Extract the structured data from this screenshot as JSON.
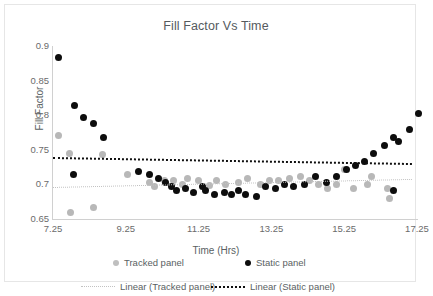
{
  "chart_data": {
    "type": "scatter",
    "title": "Fill Factor Vs Time",
    "xlabel": "Time (Hrs)",
    "ylabel": "Fill Factor",
    "xlim": [
      7.25,
      17.25
    ],
    "ylim": [
      0.65,
      0.9
    ],
    "xticks": [
      "7.25",
      "9.25",
      "11.25",
      "13.25",
      "15.25",
      "17.25"
    ],
    "yticks": [
      "0.9",
      "0.85",
      "0.8",
      "0.75",
      "0.7",
      "0.65"
    ],
    "grid": false,
    "legend_position": "bottom",
    "series": [
      {
        "name": "Tracked panel",
        "color": "#b8b8b8",
        "marker": "circle",
        "points": [
          [
            7.4,
            0.771
          ],
          [
            7.7,
            0.745
          ],
          [
            7.73,
            0.659
          ],
          [
            8.35,
            0.667
          ],
          [
            8.6,
            0.743
          ],
          [
            9.3,
            0.715
          ],
          [
            9.9,
            0.703
          ],
          [
            10.05,
            0.697
          ],
          [
            10.3,
            0.706
          ],
          [
            10.55,
            0.706
          ],
          [
            10.8,
            0.7
          ],
          [
            10.95,
            0.709
          ],
          [
            11.25,
            0.706
          ],
          [
            11.55,
            0.699
          ],
          [
            11.75,
            0.705
          ],
          [
            12.0,
            0.7
          ],
          [
            12.35,
            0.703
          ],
          [
            12.6,
            0.709
          ],
          [
            12.95,
            0.7
          ],
          [
            13.2,
            0.706
          ],
          [
            13.45,
            0.706
          ],
          [
            13.75,
            0.709
          ],
          [
            14.05,
            0.712
          ],
          [
            14.3,
            0.706
          ],
          [
            14.55,
            0.7
          ],
          [
            14.8,
            0.694
          ],
          [
            15.05,
            0.7
          ],
          [
            15.25,
            0.721
          ],
          [
            15.5,
            0.694
          ],
          [
            15.9,
            0.7
          ],
          [
            16.0,
            0.712
          ],
          [
            16.45,
            0.694
          ],
          [
            16.5,
            0.68
          ]
        ]
      },
      {
        "name": "Static panel",
        "color": "#0d0d0d",
        "marker": "circle",
        "points": [
          [
            7.4,
            0.883
          ],
          [
            7.85,
            0.814
          ],
          [
            8.1,
            0.797
          ],
          [
            8.35,
            0.788
          ],
          [
            8.65,
            0.768
          ],
          [
            7.8,
            0.715
          ],
          [
            9.6,
            0.718
          ],
          [
            9.9,
            0.715
          ],
          [
            10.15,
            0.709
          ],
          [
            10.35,
            0.703
          ],
          [
            10.5,
            0.697
          ],
          [
            10.65,
            0.691
          ],
          [
            10.9,
            0.694
          ],
          [
            11.1,
            0.688
          ],
          [
            11.35,
            0.697
          ],
          [
            11.45,
            0.691
          ],
          [
            11.7,
            0.685
          ],
          [
            11.95,
            0.688
          ],
          [
            12.15,
            0.685
          ],
          [
            12.35,
            0.691
          ],
          [
            12.55,
            0.685
          ],
          [
            12.85,
            0.683
          ],
          [
            13.1,
            0.697
          ],
          [
            13.35,
            0.694
          ],
          [
            13.6,
            0.7
          ],
          [
            13.85,
            0.697
          ],
          [
            14.15,
            0.7
          ],
          [
            14.45,
            0.712
          ],
          [
            14.75,
            0.703
          ],
          [
            15.05,
            0.712
          ],
          [
            15.3,
            0.721
          ],
          [
            15.55,
            0.727
          ],
          [
            15.8,
            0.733
          ],
          [
            16.05,
            0.744
          ],
          [
            16.35,
            0.756
          ],
          [
            16.6,
            0.768
          ],
          [
            16.75,
            0.762
          ],
          [
            16.6,
            0.691
          ],
          [
            17.05,
            0.78
          ],
          [
            17.3,
            0.803
          ]
        ]
      }
    ],
    "trendlines": [
      {
        "name": "Linear (Tracked panel)",
        "color": "#c2c2c2",
        "style": "dotted",
        "x0": 7.25,
        "y0": 0.6958,
        "x1": 17.1,
        "y1": 0.7075
      },
      {
        "name": "Linear (Static panel)",
        "color": "#0f0f0f",
        "style": "dotted",
        "x0": 7.25,
        "y0": 0.7397,
        "x1": 17.1,
        "y1": 0.731
      }
    ]
  },
  "legend": {
    "tracked_panel": "Tracked panel",
    "static_panel": "Static panel",
    "linear_tracked_panel": "Linear (Tracked panel)",
    "linear_static_panel": "Linear (Static panel)"
  }
}
